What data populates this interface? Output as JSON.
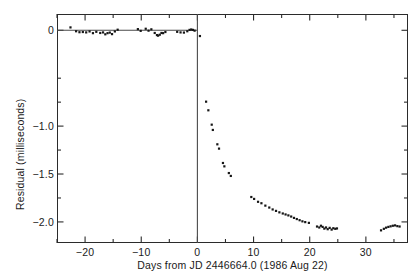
{
  "figure": {
    "background_color": "#ffffff",
    "frame_color": "#2b2b2b",
    "marker_color": "#161616"
  },
  "axes": {
    "x_title": "Days from JD 2446664.0 (1986 Aug 22)",
    "y_title": "Residual (milliseconds)",
    "x_tick_labels": [
      "−20",
      "−10",
      "0",
      "10",
      "20",
      "30"
    ],
    "y_tick_labels": [
      "0",
      "−1.0",
      "−1.5",
      "−2.0"
    ]
  },
  "chart_data": {
    "type": "scatter",
    "title": "",
    "xlabel": "Days from JD 2446664.0 (1986 Aug 22)",
    "ylabel": "Residual (milliseconds)",
    "xlim": [
      -25.0,
      37.5
    ],
    "ylim": [
      -2.22,
      0.17
    ],
    "grid": false,
    "legend": null,
    "x_major_ticks": [
      -20,
      -10,
      0,
      10,
      20,
      30
    ],
    "x_minor_ticks": [
      -25,
      -15,
      -5,
      5,
      15,
      25,
      35
    ],
    "y_major_ticks": [
      0,
      -1.0,
      -1.5,
      -2.0
    ],
    "y_minor_ticks": [
      -0.5,
      -0.75,
      -1.25,
      -1.75
    ],
    "y_labeled_ticks": [
      0,
      -1.0,
      -1.5,
      -2.0
    ],
    "reference_lines": [
      {
        "name": "zero-residual-line",
        "orientation": "horizontal",
        "value": 0.0,
        "x_from": -25.0,
        "x_to": 0.0
      },
      {
        "name": "glitch-epoch-line",
        "orientation": "vertical",
        "value": 0.0,
        "y_from": 0.17,
        "y_to": -2.22
      }
    ],
    "series": [
      {
        "name": "timing residuals",
        "marker": "square-dot",
        "points": [
          [
            -22.6,
            0.03
          ],
          [
            -21.6,
            -0.01
          ],
          [
            -21.0,
            -0.02
          ],
          [
            -20.4,
            -0.018
          ],
          [
            -19.8,
            -0.022
          ],
          [
            -19.2,
            -0.012
          ],
          [
            -18.6,
            -0.03
          ],
          [
            -18.0,
            -0.016
          ],
          [
            -17.3,
            -0.028
          ],
          [
            -16.8,
            -0.022
          ],
          [
            -16.4,
            -0.042
          ],
          [
            -16.0,
            -0.03
          ],
          [
            -15.6,
            -0.024
          ],
          [
            -15.2,
            -0.04
          ],
          [
            -14.7,
            -0.012
          ],
          [
            -14.2,
            0.006
          ],
          [
            -10.6,
            0.012
          ],
          [
            -10.1,
            -0.006
          ],
          [
            -9.2,
            0.016
          ],
          [
            -8.7,
            -0.004
          ],
          [
            -8.2,
            0.01
          ],
          [
            -7.6,
            -0.028
          ],
          [
            -7.2,
            -0.05
          ],
          [
            -7.0,
            -0.056
          ],
          [
            -6.7,
            -0.046
          ],
          [
            -6.4,
            -0.028
          ],
          [
            -6.1,
            -0.03
          ],
          [
            -5.7,
            -0.018
          ],
          [
            -3.6,
            -0.016
          ],
          [
            -3.0,
            -0.022
          ],
          [
            -2.4,
            -0.024
          ],
          [
            -1.8,
            -0.01
          ],
          [
            -1.4,
            0.004
          ],
          [
            -1.1,
            0.008
          ],
          [
            -0.8,
            0.004
          ],
          [
            -0.5,
            -0.004
          ],
          [
            0.45,
            -0.06
          ],
          [
            1.55,
            -0.745
          ],
          [
            1.95,
            -0.835
          ],
          [
            2.55,
            -0.985
          ],
          [
            2.75,
            -1.04
          ],
          [
            3.55,
            -1.19
          ],
          [
            3.85,
            -1.235
          ],
          [
            4.55,
            -1.385
          ],
          [
            4.8,
            -1.42
          ],
          [
            5.6,
            -1.49
          ],
          [
            5.95,
            -1.52
          ],
          [
            9.6,
            -1.74
          ],
          [
            10.1,
            -1.76
          ],
          [
            10.8,
            -1.79
          ],
          [
            11.4,
            -1.805
          ],
          [
            12.1,
            -1.83
          ],
          [
            12.8,
            -1.85
          ],
          [
            13.4,
            -1.87
          ],
          [
            14.0,
            -1.885
          ],
          [
            14.6,
            -1.9
          ],
          [
            15.2,
            -1.912
          ],
          [
            15.7,
            -1.922
          ],
          [
            16.2,
            -1.932
          ],
          [
            16.7,
            -1.944
          ],
          [
            17.2,
            -1.958
          ],
          [
            17.7,
            -1.97
          ],
          [
            18.2,
            -1.982
          ],
          [
            18.7,
            -1.994
          ],
          [
            19.2,
            -2.002
          ],
          [
            19.85,
            -2.01
          ],
          [
            21.3,
            -2.048
          ],
          [
            21.7,
            -2.058
          ],
          [
            22.0,
            -2.04
          ],
          [
            22.3,
            -2.052
          ],
          [
            22.6,
            -2.07
          ],
          [
            22.9,
            -2.058
          ],
          [
            23.2,
            -2.076
          ],
          [
            23.55,
            -2.062
          ],
          [
            23.9,
            -2.08
          ],
          [
            24.2,
            -2.066
          ],
          [
            24.55,
            -2.072
          ],
          [
            24.85,
            -2.068
          ],
          [
            32.7,
            -2.088
          ],
          [
            33.2,
            -2.072
          ],
          [
            33.6,
            -2.06
          ],
          [
            34.0,
            -2.052
          ],
          [
            34.4,
            -2.046
          ],
          [
            34.8,
            -2.04
          ],
          [
            35.2,
            -2.036
          ],
          [
            35.6,
            -2.044
          ],
          [
            36.0,
            -2.048
          ]
        ]
      }
    ]
  }
}
